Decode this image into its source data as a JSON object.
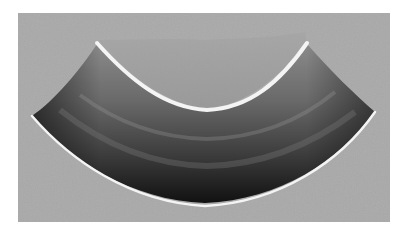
{
  "image": {
    "subject": "sectioned pipe elbow",
    "description": "Grayscale photograph of a cut curved pipe elbow section on a gray background",
    "colors": {
      "page_background": "#ffffff",
      "frame_background": "#a9a9a9",
      "metal_dark": "#1e1e1e",
      "metal_mid": "#5a5a5a",
      "metal_light": "#8e8e8e",
      "cut_edge": "#f4f4f4"
    },
    "frame": {
      "x": 18,
      "y": 13,
      "width": 372,
      "height": 209
    }
  }
}
